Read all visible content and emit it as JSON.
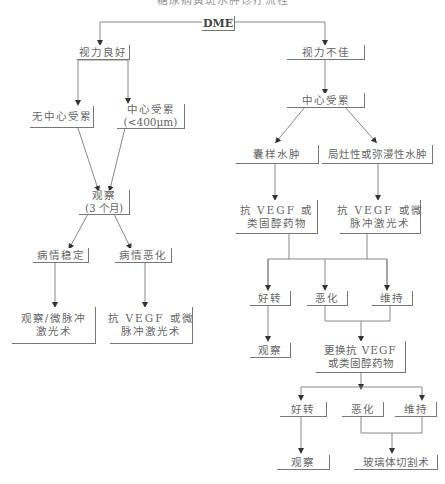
{
  "title": "糖尿病黄斑水肿诊疗流程",
  "nodes": {
    "dme": "DME",
    "good_vision": "视力良好",
    "poor_vision": "视力不佳",
    "non_central": "无中心受累",
    "central_small": {
      "line1": "中心受累",
      "line2": "(<400μm)"
    },
    "observe3": {
      "line1": "观察",
      "line2": "(3 个月)"
    },
    "stable": "病情稳定",
    "worse_left": "病情恶化",
    "observe_laser": {
      "line1": "观察/微脉冲",
      "line2": "激光术"
    },
    "antivegf_laser_left": {
      "line1": "抗 VEGF 或微",
      "line2": "脉冲激光术"
    },
    "central": "中心受累",
    "cystoid": "囊样水肿",
    "focal_diffuse": "局灶性或弥漫性水肿",
    "antivegf_steroid": {
      "line1": "抗 VEGF 或",
      "line2": "类固醇药物"
    },
    "antivegf_laser_right": {
      "line1": "抗 VEGF 或微",
      "line2": "脉冲激光术"
    },
    "improve1": "好转",
    "worse1": "恶化",
    "maintain1": "维持",
    "observe_r1": "观察",
    "switch": {
      "line1": "更换抗 VEGF",
      "line2": "或类固醇药物"
    },
    "improve2": "好转",
    "worse2": "恶化",
    "maintain2": "维持",
    "observe_r2": "观察",
    "vitrectomy": "玻璃体切割术"
  },
  "colors": {
    "line": "#777777",
    "text": "#666666",
    "background": "#ffffff"
  }
}
